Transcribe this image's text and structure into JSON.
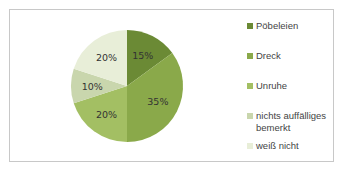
{
  "chart_data": {
    "type": "pie",
    "title": "",
    "categories": [
      "Pöbeleien",
      "Dreck",
      "Unruhe",
      "nichts auffälliges bemerkt",
      "weiß nicht"
    ],
    "values": [
      15,
      35,
      20,
      10,
      20
    ],
    "labels": [
      "15%",
      "35%",
      "20%",
      "10%",
      "20%"
    ],
    "colors": [
      "#6b8a35",
      "#8aa94a",
      "#a3bf63",
      "#c9d6ad",
      "#e8eed8"
    ],
    "start_angle": "12 o'clock, clockwise",
    "legend_position": "right"
  },
  "legend": {
    "items": [
      {
        "label": "Pöbeleien",
        "color": "#6b8a35"
      },
      {
        "label": "Dreck",
        "color": "#8aa94a"
      },
      {
        "label": "Unruhe",
        "color": "#a3bf63"
      },
      {
        "label": "nichts auffälliges bemerkt",
        "color": "#c9d6ad"
      },
      {
        "label": "weiß nicht",
        "color": "#e8eed8"
      }
    ]
  }
}
